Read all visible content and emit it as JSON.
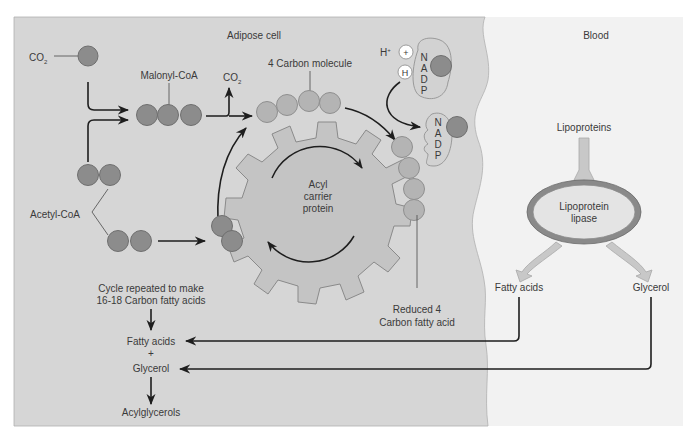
{
  "regions": {
    "cell": {
      "label": "Adipose cell",
      "color": "#d6d6d6"
    },
    "blood": {
      "label": "Blood",
      "color": "#f2f2f2"
    }
  },
  "labels": {
    "co2_in": "CO",
    "co2_in_sub": "2",
    "co2_out": "CO",
    "co2_out_sub": "2",
    "malonyl_coa": "Malonyl-CoA",
    "acetyl_coa": "Acetyl-CoA",
    "four_carbon": "4 Carbon molecule",
    "h_plus": "H",
    "h_plus_sup": "+",
    "plus_sign": "+",
    "h_atom": "H",
    "nadp_letters": [
      "N",
      "A",
      "D",
      "P"
    ],
    "acyl_line1": "Acyl",
    "acyl_line2": "carrier",
    "acyl_line3": "protein",
    "reduced_line1": "Reduced 4",
    "reduced_line2": "Carbon fatty acid",
    "cycle_line1": "Cycle repeated to make",
    "cycle_line2": "16-18 Carbon fatty acids",
    "fatty_acids_cell": "Fatty acids",
    "plus": "+",
    "glycerol_cell": "Glycerol",
    "acylglycerols": "Acylglycerols",
    "lipoproteins": "Lipoproteins",
    "lipase_line1": "Lipoprotein",
    "lipase_line2": "lipase",
    "fatty_acids_blood": "Fatty acids",
    "glycerol_blood": "Glycerol"
  }
}
